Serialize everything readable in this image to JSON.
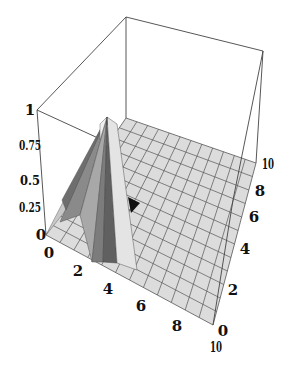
{
  "chart_data": {
    "type": "surface3d",
    "title": "",
    "xlabel": "",
    "ylabel": "",
    "zlabel": "",
    "x_ticks": [
      "0",
      "2",
      "4",
      "6",
      "8",
      "10"
    ],
    "y_ticks": [
      "0",
      "2",
      "4",
      "6",
      "8",
      "10"
    ],
    "z_ticks": [
      "0",
      "0.25",
      "0.5",
      "0.75",
      "1"
    ],
    "xlim": [
      0,
      10
    ],
    "ylim": [
      0,
      10
    ],
    "zlim": [
      0,
      1
    ],
    "grid": true,
    "bounding_box": true,
    "peak": {
      "x": 2.5,
      "y": 0.5,
      "z": 0.8
    },
    "surface_color": "#d8d8d8",
    "shade_colors": [
      "#e6e6e6",
      "#bdbdbd",
      "#9a9a9a",
      "#7a7a7a",
      "#5e5e5e"
    ]
  },
  "labels": {
    "z": {
      "t0": "0",
      "t1": "0.25",
      "t2": "0.5",
      "t3": "0.75",
      "t4": "1"
    },
    "x": {
      "t0": "0",
      "t1": "2",
      "t2": "4",
      "t3": "6",
      "t4": "8",
      "t5": "10"
    },
    "y": {
      "t0": "0",
      "t1": "2",
      "t2": "4",
      "t3": "6",
      "t4": "8",
      "t5": "10"
    }
  }
}
